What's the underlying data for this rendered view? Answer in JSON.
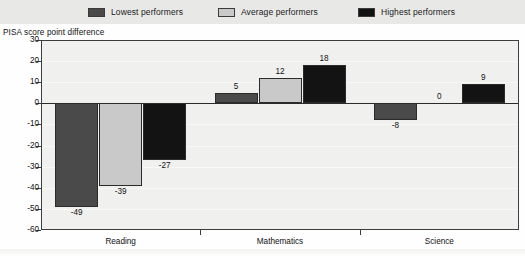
{
  "legend": {
    "items": [
      {
        "label": "Lowest performers",
        "color": "#4a4a4a",
        "icon": "square-swatch-icon"
      },
      {
        "label": "Average performers",
        "color": "#c9c9c9",
        "icon": "square-swatch-icon"
      },
      {
        "label": "Highest performers",
        "color": "#131313",
        "icon": "square-swatch-icon"
      }
    ]
  },
  "chart_data": {
    "type": "bar",
    "title": "",
    "ylabel": "PISA score point difference",
    "xlabel": "",
    "categories": [
      "Reading",
      "Mathematics",
      "Science"
    ],
    "series": [
      {
        "name": "Lowest performers",
        "color": "#4a4a4a",
        "values": [
          -49,
          5,
          -8
        ]
      },
      {
        "name": "Average performers",
        "color": "#c9c9c9",
        "values": [
          -39,
          12,
          0
        ]
      },
      {
        "name": "Highest performers",
        "color": "#131313",
        "values": [
          -27,
          18,
          9
        ]
      }
    ],
    "ylim": [
      -60,
      30
    ],
    "yticks": [
      30,
      20,
      10,
      0,
      -10,
      -20,
      -30,
      -40,
      -50,
      -60
    ],
    "ytick_labels": [
      "30",
      "20",
      "10",
      "0",
      "-10",
      "-20",
      "-30",
      "-40",
      "-50",
      "-60"
    ],
    "grid": true,
    "legend_position": "top",
    "zero_line": true,
    "data_labels": [
      [
        "-49",
        "-39",
        "-27"
      ],
      [
        "5",
        "12",
        "18"
      ],
      [
        "-8",
        "0",
        "9"
      ]
    ]
  }
}
